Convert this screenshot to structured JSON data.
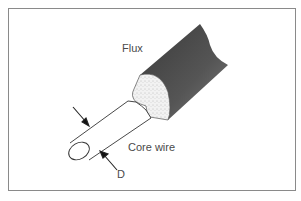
{
  "diagram": {
    "labels": {
      "flux": "Flux",
      "core_wire": "Core wire",
      "diameter": "D"
    },
    "colors": {
      "flux_coating": "#4d4d4d",
      "frame_border": "#8a8a8a",
      "stipple": "#efefef",
      "line": "#333333",
      "text": "#4a4a4a"
    }
  }
}
